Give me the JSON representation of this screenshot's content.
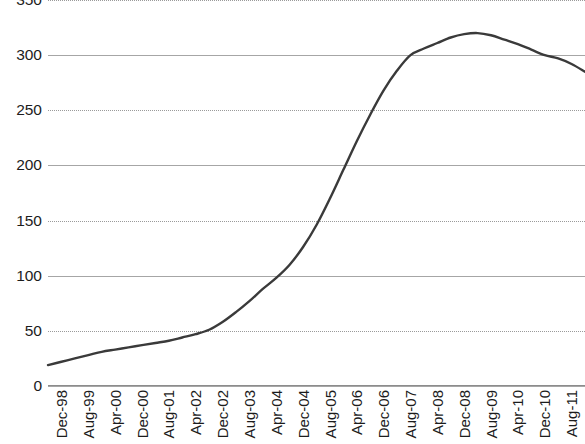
{
  "chart_data": {
    "type": "line",
    "title": "",
    "subtitle": "",
    "xlabel": "",
    "ylabel": "",
    "ylim": [
      0,
      350
    ],
    "yticks": [
      0,
      50,
      100,
      150,
      200,
      250,
      300,
      350
    ],
    "ytick_labels": [
      "0",
      "50",
      "100",
      "150",
      "200",
      "250",
      "300",
      "350"
    ],
    "grid": true,
    "grid_orientation": "horizontal",
    "legend": false,
    "legend_position": "none",
    "line_color": "#3a3a3a",
    "line_width": 2.4,
    "markers": false,
    "x_tick_interval_months": 8,
    "x_tick_labels": [
      "Dec-98",
      "Aug-99",
      "Apr-00",
      "Dec-00",
      "Aug-01",
      "Apr-02",
      "Dec-02",
      "Aug-03",
      "Apr-04",
      "Dec-04",
      "Aug-05",
      "Apr-06",
      "Dec-06",
      "Aug-07",
      "Apr-08",
      "Dec-08",
      "Aug-09",
      "Apr-10",
      "Dec-10",
      "Aug-11",
      "Apr-12"
    ],
    "x": [
      "Dec-98",
      "Apr-99",
      "Aug-99",
      "Dec-99",
      "Apr-00",
      "Aug-00",
      "Dec-00",
      "Apr-01",
      "Aug-01",
      "Dec-01",
      "Apr-02",
      "Aug-02",
      "Dec-02",
      "Apr-03",
      "Aug-03",
      "Dec-03",
      "Apr-04",
      "Aug-04",
      "Dec-04",
      "Apr-05",
      "Aug-05",
      "Dec-05",
      "Apr-06",
      "Aug-06",
      "Dec-06",
      "Apr-07",
      "Aug-07",
      "Dec-07",
      "Apr-08",
      "Aug-08",
      "Dec-08",
      "Apr-09",
      "Aug-09",
      "Dec-09",
      "Apr-10",
      "Aug-10",
      "Dec-10",
      "Apr-11",
      "Aug-11",
      "Dec-11",
      "Apr-12"
    ],
    "series": [
      {
        "name": "Index",
        "values": [
          19,
          22,
          25,
          28,
          31,
          33,
          35,
          37,
          39,
          41,
          44,
          47,
          51,
          58,
          67,
          77,
          88,
          98,
          110,
          126,
          146,
          170,
          196,
          222,
          246,
          268,
          286,
          300,
          306,
          311,
          316,
          319,
          320,
          318,
          314,
          310,
          305,
          300,
          297,
          292,
          285
        ]
      }
    ]
  }
}
